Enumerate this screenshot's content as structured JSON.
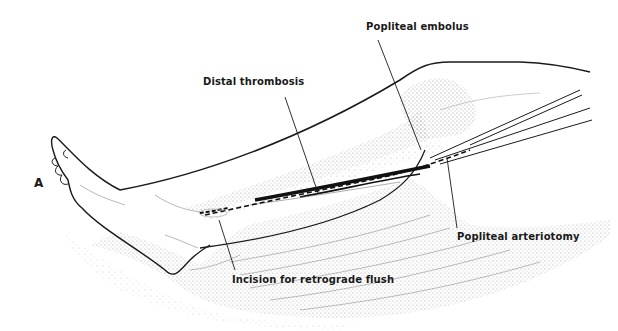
{
  "figure": {
    "panel_letter": "A",
    "labels": {
      "popliteal_embolus": "Popliteal embolus",
      "distal_thrombosis": "Distal thrombosis",
      "popliteal_arteriotomy": "Popliteal arteriotomy",
      "incision_retrograde_flush": "Incision for retrograde flush"
    },
    "colors": {
      "ink": "#1a1a1a",
      "stipple": "#888888",
      "background": "#ffffff"
    }
  }
}
